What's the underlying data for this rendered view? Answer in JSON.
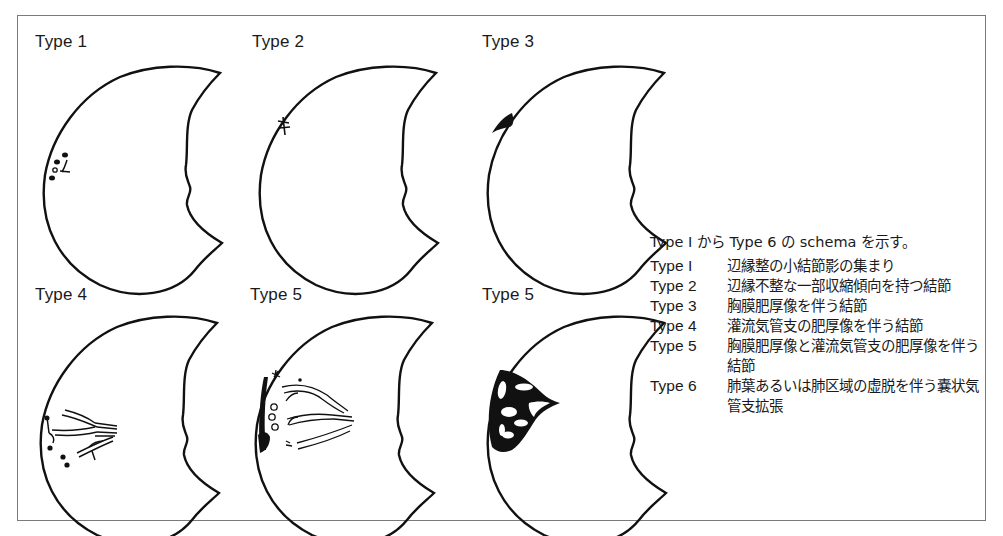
{
  "figure": {
    "panels": [
      {
        "id": "type1",
        "label": "Type 1"
      },
      {
        "id": "type2",
        "label": "Type 2"
      },
      {
        "id": "type3",
        "label": "Type 3"
      },
      {
        "id": "type4",
        "label": "Type 4"
      },
      {
        "id": "type5",
        "label": "Type 5"
      },
      {
        "id": "type6",
        "label": "Type 5"
      }
    ],
    "legend": {
      "intro": "Type I から Type 6 の schema を示す。",
      "items": [
        {
          "type": "Type I",
          "desc": "辺縁整の小結節影の集まり"
        },
        {
          "type": "Type 2",
          "desc": "辺縁不整な一部収縮傾向を持つ結節"
        },
        {
          "type": "Type 3",
          "desc": "胸膜肥厚像を伴う結節"
        },
        {
          "type": "Type 4",
          "desc": "灌流気管支の肥厚像を伴う結節"
        },
        {
          "type": "Type 5",
          "desc": "胸膜肥厚像と灌流気管支の肥厚像を伴う結節"
        },
        {
          "type": "Type 6",
          "desc": "肺葉あるいは肺区域の虚脱を伴う嚢状気管支拡張"
        }
      ]
    },
    "colors": {
      "stroke": "#111111",
      "frame": "#7a7a7a",
      "background": "#ffffff"
    }
  }
}
